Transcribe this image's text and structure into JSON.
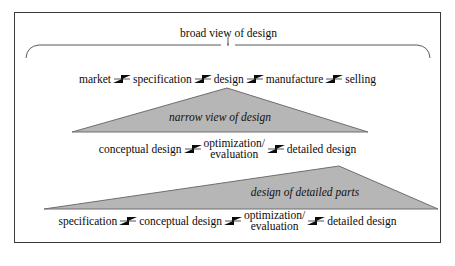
{
  "figure": {
    "background_color": "#ffffff",
    "border_color": "#3a3a3a",
    "triangle_fill": "#b6b6b6",
    "triangle_stroke": "#6e6e6e",
    "text_color": "#0b0b0b"
  },
  "bracket": {
    "label": "broad view of design"
  },
  "rows": [
    {
      "id": "broad-view-row",
      "nodes": [
        {
          "line1": "market",
          "line2": ""
        },
        {
          "line1": "specification",
          "line2": ""
        },
        {
          "line1": "design",
          "line2": ""
        },
        {
          "line1": "manufacture",
          "line2": ""
        },
        {
          "line1": "selling",
          "line2": ""
        }
      ]
    },
    {
      "id": "narrow-view-row",
      "nodes": [
        {
          "line1": "conceptual design",
          "line2": ""
        },
        {
          "line1": "optimization/",
          "line2": "evaluation"
        },
        {
          "line1": "detailed design",
          "line2": ""
        }
      ]
    },
    {
      "id": "detailed-parts-row",
      "nodes": [
        {
          "line1": "specification",
          "line2": ""
        },
        {
          "line1": "conceptual design",
          "line2": ""
        },
        {
          "line1": "optimization/",
          "line2": "evaluation"
        },
        {
          "line1": "detailed design",
          "line2": ""
        }
      ]
    }
  ],
  "triangles": [
    {
      "id": "narrow-view-triangle",
      "label": "narrow view of design"
    },
    {
      "id": "detailed-parts-triangle",
      "label": "design of detailed parts"
    }
  ]
}
